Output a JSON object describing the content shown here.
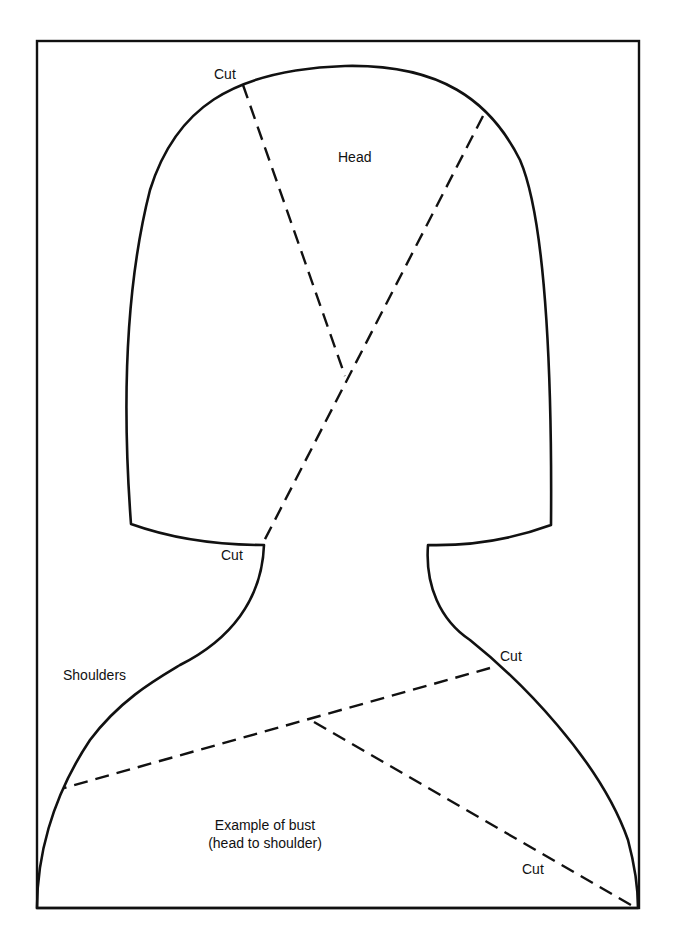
{
  "diagram": {
    "regions": {
      "head": {
        "label": "Head"
      },
      "shoulders": {
        "label": "Shoulders"
      },
      "caption": {
        "line1": "Example of bust",
        "line2": "(head to shoulder)"
      }
    },
    "cut_labels": [
      {
        "id": "cut-top-left",
        "label": "Cut"
      },
      {
        "id": "cut-neck-left",
        "label": "Cut"
      },
      {
        "id": "cut-shoulder-right",
        "label": "Cut"
      },
      {
        "id": "cut-bottom-right",
        "label": "Cut"
      }
    ],
    "colors": {
      "stroke": "#111111",
      "background": "#ffffff"
    },
    "line_styles": {
      "outline": "solid",
      "cut_lines": "dashed"
    }
  }
}
